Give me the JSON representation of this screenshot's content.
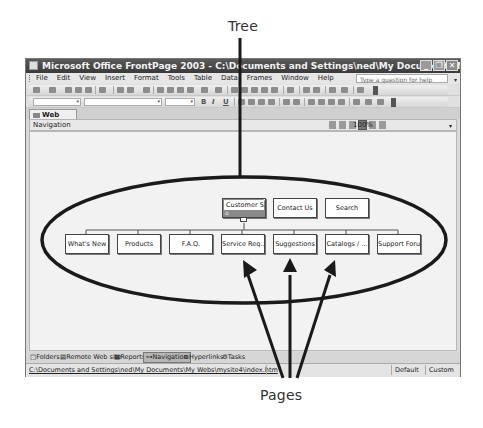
{
  "callouts": {
    "tree": "Tree",
    "pages": "Pages"
  },
  "window": {
    "title": "Microsoft Office FrontPage 2003 - C:\\Documents and Settings\\ned\\My Documents\\My Webs\\mysite4",
    "buttons": {
      "minimize": "_",
      "maximize": "❐",
      "close": "✕"
    }
  },
  "menubar": {
    "items": [
      "File",
      "Edit",
      "View",
      "Insert",
      "Format",
      "Tools",
      "Table",
      "Data",
      "Frames",
      "Window",
      "Help"
    ],
    "help_placeholder": "Type a question for help"
  },
  "toolbars": {
    "formatting": {
      "style_value": "",
      "font_value": "",
      "size_value": "",
      "bold": "B",
      "italic": "I",
      "underline": "U"
    }
  },
  "doc_tabs": [
    {
      "label": "Web Site",
      "active": true
    }
  ],
  "navigation_pane": {
    "title": "Navigation",
    "zoom": "100%"
  },
  "tree": {
    "top_level": [
      {
        "label": "Customer S...",
        "home": true,
        "selected": true
      },
      {
        "label": "Contact Us"
      },
      {
        "label": "Search"
      }
    ],
    "children": [
      {
        "label": "What's New"
      },
      {
        "label": "Products"
      },
      {
        "label": "F.A.Q."
      },
      {
        "label": "Service Req..."
      },
      {
        "label": "Suggestions"
      },
      {
        "label": "Catalogs / ..."
      },
      {
        "label": "Support Forum"
      }
    ]
  },
  "view_tabs": [
    {
      "label": "Folders",
      "icon": "□"
    },
    {
      "label": "Remote Web site",
      "icon": "▤"
    },
    {
      "label": "Reports",
      "icon": "▦"
    },
    {
      "label": "Navigation",
      "icon": "⊶",
      "active": true
    },
    {
      "label": "Hyperlinks",
      "icon": "⧉"
    },
    {
      "label": "Tasks",
      "icon": "⚙"
    }
  ],
  "statusbar": {
    "path": "C:\\Documents and Settings\\ned\\My Documents\\My Webs\\mysite4\\index.htm",
    "cells": [
      "Default",
      "Custom"
    ]
  },
  "colors": {
    "titlebar": "#4a4a4a",
    "canvas": "#f2f2f2",
    "annotation": "#1a1a1a"
  }
}
